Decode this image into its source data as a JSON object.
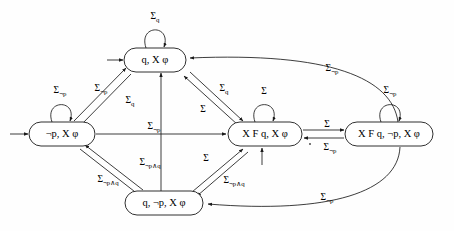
{
  "diagram": {
    "type": "finite-state-automaton",
    "title": "",
    "alphabet_symbol": "Σ",
    "states": [
      {
        "id": "q_Xphi",
        "label": "q, X φ",
        "label_parts": [
          "q,",
          "X",
          "φ"
        ],
        "x": 155,
        "y": 60,
        "w": 62,
        "h": 24,
        "initial": true,
        "initial_arrow_side": "left",
        "self_loop": {
          "label": "Σ",
          "sub": "q",
          "side": "top"
        }
      },
      {
        "id": "notp_Xphi",
        "label": "¬p, X φ",
        "label_parts": [
          "¬p,",
          "X",
          "φ"
        ],
        "x": 62,
        "y": 134,
        "w": 66,
        "h": 24,
        "initial": true,
        "initial_arrow_side": "left",
        "self_loop": {
          "label": "Σ",
          "sub": "¬p",
          "side": "top"
        }
      },
      {
        "id": "XFq_Xphi",
        "label": "X F q, X φ",
        "label_parts": [
          "X F",
          "q,",
          "X",
          "φ"
        ],
        "x": 265,
        "y": 134,
        "w": 74,
        "h": 24,
        "initial": true,
        "initial_arrow_side": "bottom",
        "self_loop": {
          "label": "Σ",
          "sub": "",
          "side": "top"
        }
      },
      {
        "id": "XFq_notp_Xphi",
        "label": "X F q, ¬p, X φ",
        "label_parts": [
          "X F",
          "q,",
          "¬p,",
          "X",
          "φ"
        ],
        "x": 389,
        "y": 134,
        "w": 88,
        "h": 24,
        "initial": false,
        "initial_arrow_side": "",
        "self_loop": {
          "label": "Σ",
          "sub": "¬p",
          "side": "top"
        }
      },
      {
        "id": "q_notp_Xphi",
        "label": "q, ¬p, X φ",
        "label_parts": [
          "q,",
          "¬p,",
          "X",
          "φ"
        ],
        "x": 164,
        "y": 203,
        "w": 78,
        "h": 24,
        "initial": false,
        "initial_arrow_side": "",
        "self_loop": null
      }
    ],
    "self_loop_labels": [
      {
        "for": "q_Xphi",
        "base": "Σ",
        "sub": "q",
        "x": 155,
        "y": 17
      },
      {
        "for": "notp_Xphi",
        "base": "Σ",
        "sub": "¬p",
        "x": 60,
        "y": 91
      },
      {
        "for": "XFq_Xphi",
        "base": "Σ",
        "sub": "",
        "x": 264,
        "y": 92
      },
      {
        "for": "XFq_notp_Xphi",
        "base": "Σ",
        "sub": "¬p",
        "x": 390,
        "y": 91
      }
    ],
    "transitions": [
      {
        "from": "notp_Xphi",
        "to": "q_Xphi",
        "base": "Σ",
        "sub": "¬p",
        "label_x": 101,
        "label_y": 89
      },
      {
        "from": "q_Xphi",
        "to": "notp_Xphi",
        "base": "Σ",
        "sub": "q",
        "label_x": 130,
        "label_y": 101
      },
      {
        "from": "q_Xphi",
        "to": "XFq_Xphi",
        "base": "Σ",
        "sub": "q",
        "label_x": 224,
        "label_y": 89
      },
      {
        "from": "XFq_Xphi",
        "to": "q_Xphi",
        "base": "Σ",
        "sub": "",
        "label_x": 203,
        "label_y": 110
      },
      {
        "from": "notp_Xphi",
        "to": "XFq_Xphi",
        "base": "Σ",
        "sub": "¬p",
        "label_x": 154,
        "label_y": 127
      },
      {
        "from": "notp_Xphi",
        "to": "q_notp_Xphi",
        "base": "Σ",
        "sub": "¬p∧q",
        "label_x": 108,
        "label_y": 180
      },
      {
        "from": "q_notp_Xphi",
        "to": "notp_Xphi",
        "base": "Σ",
        "sub": "¬p∧q",
        "label_x": 150,
        "label_y": 163
      },
      {
        "from": "q_notp_Xphi",
        "to": "XFq_Xphi",
        "base": "Σ",
        "sub": "",
        "label_x": 206,
        "label_y": 159
      },
      {
        "from": "XFq_Xphi",
        "to": "q_notp_Xphi",
        "base": "Σ",
        "sub": "¬p∧q",
        "label_x": 234,
        "label_y": 181
      },
      {
        "from": "XFq_Xphi",
        "to": "XFq_notp_Xphi",
        "base": "Σ",
        "sub": "",
        "label_x": 327,
        "label_y": 125
      },
      {
        "from": "XFq_notp_Xphi",
        "to": "XFq_Xphi",
        "base": "Σ",
        "sub": "¬p",
        "label_x": 330,
        "label_y": 148
      },
      {
        "from": "XFq_notp_Xphi",
        "to": "q_Xphi",
        "base": "Σ",
        "sub": "¬p",
        "label_x": 332,
        "label_y": 69
      },
      {
        "from": "XFq_notp_Xphi",
        "to": "q_notp_Xphi",
        "base": "Σ",
        "sub": "¬p",
        "label_x": 327,
        "label_y": 198
      },
      {
        "from": "q_notp_Xphi",
        "to": "q_Xphi",
        "base": "",
        "sub": "",
        "label_x": 0,
        "label_y": 0
      }
    ],
    "colors": {
      "stroke": "#1a1a1a",
      "fill": "#ffffff",
      "background": "#fefefe",
      "text": "#000000"
    }
  }
}
